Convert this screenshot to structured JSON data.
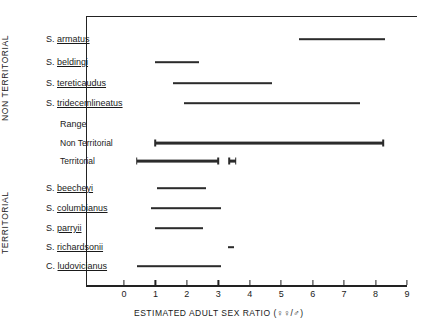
{
  "figure": {
    "group_labels": {
      "non_territorial": "NON TERRITORIAL",
      "territorial": "TERRITORIAL"
    },
    "range_heading": "Range",
    "range_rows": [
      {
        "label": "Non Territorial"
      },
      {
        "label": "Territorial"
      }
    ]
  },
  "chart_data": {
    "type": "bar",
    "title": "",
    "xlabel": "ESTIMATED  ADULT  SEX  RATIO (♀♀/♂)",
    "ylabel": "",
    "xlim": [
      0,
      9
    ],
    "xticks": [
      0,
      1,
      2,
      3,
      4,
      5,
      6,
      7,
      8,
      9
    ],
    "xticklabels": [
      "0",
      "1",
      "2",
      "3",
      "4",
      "5",
      "6",
      "7",
      "8",
      "9"
    ],
    "grid": false,
    "legend": "none",
    "orientation": "horizontal-ranges",
    "groups": [
      {
        "name": "NON TERRITORIAL",
        "items": [
          {
            "genus": "S.",
            "epithet": "armatus",
            "low": 5.55,
            "high": 8.3,
            "style": "thin"
          },
          {
            "genus": "S.",
            "epithet": "beldingi",
            "low": 1.0,
            "high": 2.4,
            "style": "thin"
          },
          {
            "genus": "S.",
            "epithet": "tereticaudus",
            "low": 1.55,
            "high": 4.7,
            "style": "thin"
          },
          {
            "genus": "S.",
            "epithet": "tridecemlineatus",
            "low": 1.9,
            "high": 7.5,
            "style": "thin"
          }
        ]
      },
      {
        "name": "Range",
        "items": [
          {
            "genus": "",
            "epithet": "Non Territorial",
            "low": 1.0,
            "high": 8.25,
            "style": "thick-capped"
          },
          {
            "genus": "",
            "epithet": "Territorial",
            "low": 0.4,
            "high": 3.0,
            "style": "thick-capped"
          },
          {
            "genus": "",
            "epithet": "Territorial-outlier",
            "low": 3.35,
            "high": 3.55,
            "style": "thick-capped"
          }
        ]
      },
      {
        "name": "TERRITORIAL",
        "items": [
          {
            "genus": "S.",
            "epithet": "beecheyi",
            "low": 1.05,
            "high": 2.6,
            "style": "thin"
          },
          {
            "genus": "S.",
            "epithet": "columbianus",
            "low": 0.85,
            "high": 3.1,
            "style": "thin"
          },
          {
            "genus": "S.",
            "epithet": "parryii",
            "low": 1.0,
            "high": 2.5,
            "style": "thin"
          },
          {
            "genus": "S.",
            "epithet": "richardsonii",
            "low": 3.3,
            "high": 3.5,
            "style": "thin"
          },
          {
            "genus": "C.",
            "epithet": "ludovicianus",
            "low": 0.4,
            "high": 3.1,
            "style": "thin"
          }
        ]
      }
    ]
  }
}
